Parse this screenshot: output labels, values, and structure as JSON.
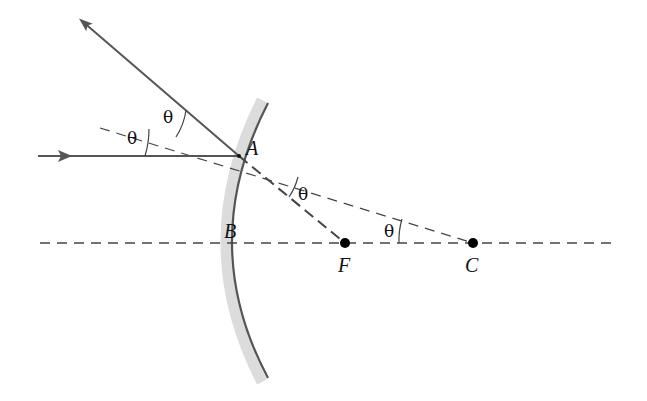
{
  "diagram": {
    "type": "convex-mirror-ray-reflection",
    "points": {
      "A": {
        "label": "A",
        "x": 239,
        "y": 156
      },
      "B": {
        "label": "B",
        "x": 219,
        "y": 243
      },
      "F": {
        "label": "F",
        "x": 345,
        "y": 243
      },
      "C": {
        "label": "C",
        "x": 473,
        "y": 243
      }
    },
    "angle_labels": {
      "incident": "θ",
      "reflected": "θ",
      "at_F": "θ",
      "at_C": "θ"
    },
    "colors": {
      "ray": "#555555",
      "dash": "#444444",
      "mirror_surface": "#555555",
      "mirror_back": "#d8d8d8",
      "point": "#000000"
    }
  }
}
